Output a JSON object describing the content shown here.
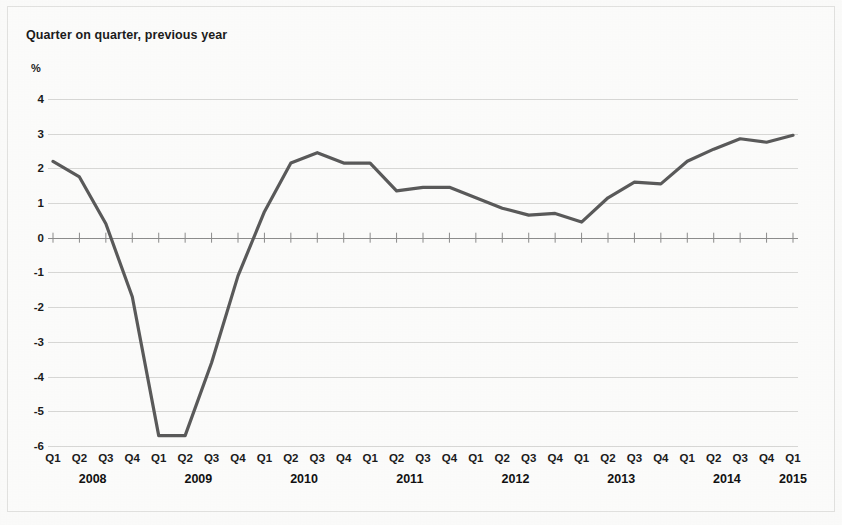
{
  "chart_data": {
    "type": "line",
    "title": "Quarter on quarter, previous year",
    "unit_label": "%",
    "xlabel": "",
    "ylabel": "",
    "ylim": [
      -6,
      4.6
    ],
    "yticks": [
      4,
      3,
      2,
      1,
      0,
      -1,
      -2,
      -3,
      -4,
      -5,
      -6
    ],
    "ytick_labels": [
      "4",
      "3",
      "2",
      "1",
      "0",
      "-1",
      "-2",
      "-3",
      "-4",
      "-5",
      "-6"
    ],
    "grid": true,
    "legend": "none",
    "line_color": "#5a5a5a",
    "grid_color": "#d8d8d6",
    "axis_color": "#8c8c8c",
    "background_color": "#fcfcfb",
    "quarters": [
      "Q1",
      "Q2",
      "Q3",
      "Q4",
      "Q1",
      "Q2",
      "Q3",
      "Q4",
      "Q1",
      "Q2",
      "Q3",
      "Q4",
      "Q1",
      "Q2",
      "Q3",
      "Q4",
      "Q1",
      "Q2",
      "Q3",
      "Q4",
      "Q1",
      "Q2",
      "Q3",
      "Q4",
      "Q1",
      "Q2",
      "Q3",
      "Q4",
      "Q1"
    ],
    "years": [
      {
        "label": "2008",
        "start_index": 0,
        "span": 4
      },
      {
        "label": "2009",
        "start_index": 4,
        "span": 4
      },
      {
        "label": "2010",
        "start_index": 8,
        "span": 4
      },
      {
        "label": "2011",
        "start_index": 12,
        "span": 4
      },
      {
        "label": "2012",
        "start_index": 16,
        "span": 4
      },
      {
        "label": "2013",
        "start_index": 20,
        "span": 4
      },
      {
        "label": "2014",
        "start_index": 24,
        "span": 4
      },
      {
        "label": "2015",
        "start_index": 28,
        "span": 1
      }
    ],
    "categories": [
      "2008 Q1",
      "2008 Q2",
      "2008 Q3",
      "2008 Q4",
      "2009 Q1",
      "2009 Q2",
      "2009 Q3",
      "2009 Q4",
      "2010 Q1",
      "2010 Q2",
      "2010 Q3",
      "2010 Q4",
      "2011 Q1",
      "2011 Q2",
      "2011 Q3",
      "2011 Q4",
      "2012 Q1",
      "2012 Q2",
      "2012 Q3",
      "2012 Q4",
      "2013 Q1",
      "2013 Q2",
      "2013 Q3",
      "2013 Q4",
      "2014 Q1",
      "2014 Q2",
      "2014 Q3",
      "2014 Q4",
      "2015 Q1"
    ],
    "values": [
      2.2,
      1.75,
      0.4,
      -1.7,
      -5.7,
      -5.7,
      -3.6,
      -1.1,
      0.75,
      2.15,
      2.45,
      2.15,
      2.15,
      1.35,
      1.45,
      1.45,
      1.15,
      0.85,
      0.65,
      0.7,
      0.45,
      1.15,
      1.6,
      1.55,
      2.2,
      2.55,
      2.85,
      2.75,
      2.95
    ],
    "series": [
      {
        "name": "Quarter on quarter, previous year",
        "values": [
          2.2,
          1.75,
          0.4,
          -1.7,
          -5.7,
          -5.7,
          -3.6,
          -1.1,
          0.75,
          2.15,
          2.45,
          2.15,
          2.15,
          1.35,
          1.45,
          1.45,
          1.15,
          0.85,
          0.65,
          0.7,
          0.45,
          1.15,
          1.6,
          1.55,
          2.2,
          2.55,
          2.85,
          2.75,
          2.95
        ]
      }
    ],
    "annotations": []
  }
}
